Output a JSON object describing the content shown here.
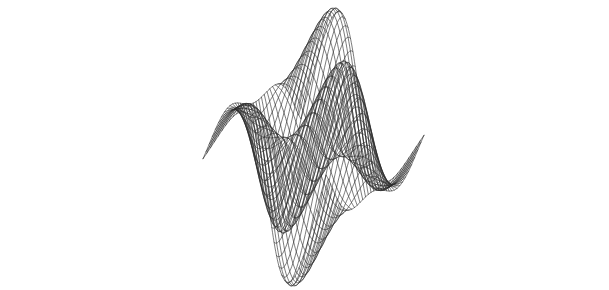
{
  "figure": {
    "kind": "3d-wireframe-surface-plot",
    "title": "",
    "subtitle": "",
    "background_color": "#ffffff",
    "line_color": "#2b2b2b",
    "line_width": 0.62,
    "width_px": 609,
    "height_px": 290,
    "has_axes": false,
    "has_axis_labels": false,
    "has_tick_labels": false,
    "has_legend": false,
    "has_colorbar": false,
    "has_border": false,
    "annotations": []
  },
  "chart_data": {
    "type": "line",
    "render_style": "wireframe-mesh-surface",
    "title": "",
    "subtitle": "",
    "xlabel": "",
    "ylabel": "",
    "zlabel": "",
    "grid": false,
    "legend": "none",
    "surface_function": "z = sin(u) * cos(v) * exp(-0.12*(u*u+v*v)/6) scaled; rendered as twisted saddle sheet",
    "formula_display": "z(u,v) = A * sin(a*u + p) * cos(b*v + q)",
    "u_range": [
      -3.35,
      3.35
    ],
    "v_range": [
      -3.35,
      3.35
    ],
    "z_range": [
      -1.0,
      1.0
    ],
    "u_gridlines": 38,
    "v_gridlines": 38,
    "projection": "parallel-oblique",
    "view_azimuth_deg": 38,
    "view_elevation_deg": 26,
    "z_exaggeration": 1.0,
    "amplitude": 1.0,
    "surface_params": {
      "A": 1.0,
      "a": 1.0,
      "b": 1.0,
      "p": 0.0,
      "q": 0.0,
      "twist": 0.45,
      "decay": 0.0
    },
    "screen_extents": {
      "left_px": 45,
      "right_px": 582,
      "top_px": 8,
      "bottom_px": 286
    },
    "projection_params": {
      "origin_x": 312,
      "origin_y": 150,
      "u_axis": [
        46.0,
        23.0
      ],
      "v_axis": [
        -38.0,
        20.5
      ],
      "z_axis": [
        6.0,
        -82.0
      ]
    },
    "series": [
      {
        "name": "u-isolines",
        "count": 38,
        "description": "Curves of constant u running across the sheet"
      },
      {
        "name": "v-isolines",
        "count": 38,
        "description": "Curves of constant v running across the sheet"
      }
    ]
  }
}
